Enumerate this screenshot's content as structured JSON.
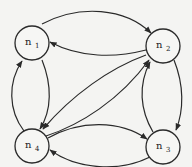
{
  "diagram": {
    "type": "directed-graph",
    "colors": {
      "background": "#f4f4f2",
      "stroke": "#2a2a2a",
      "text": "#222222"
    },
    "nodes": [
      {
        "id": "n1",
        "label": "n",
        "subscript": "1",
        "cx": 32,
        "cy": 43,
        "r": 17
      },
      {
        "id": "n2",
        "label": "n",
        "subscript": "2",
        "cx": 163,
        "cy": 46,
        "r": 17
      },
      {
        "id": "n3",
        "label": "n",
        "subscript": "3",
        "cx": 163,
        "cy": 147,
        "r": 17
      },
      {
        "id": "n4",
        "label": "n",
        "subscript": "4",
        "cx": 32,
        "cy": 146,
        "r": 17
      }
    ],
    "edges": [
      {
        "from": "n1",
        "to": "n2",
        "path": "M42,24 C80,4 125,8 151,33"
      },
      {
        "from": "n2",
        "to": "n1",
        "path": "M146,50 C115,58 80,58 50,42"
      },
      {
        "from": "n1",
        "to": "n4",
        "path": "M42,60 C52,85 52,110 40,129"
      },
      {
        "from": "n4",
        "to": "n1",
        "path": "M24,131 C8,110 8,82 22,61"
      },
      {
        "from": "n2",
        "to": "n3",
        "path": "M174,60 C184,85 184,110 176,130"
      },
      {
        "from": "n3",
        "to": "n2",
        "path": "M153,132 C140,110 138,85 150,62"
      },
      {
        "from": "n4",
        "to": "n3",
        "path": "M48,138 C80,120 120,120 147,139"
      },
      {
        "from": "n3",
        "to": "n4",
        "path": "M150,157 C120,172 78,170 50,150"
      },
      {
        "from": "n4",
        "to": "n2",
        "path": "M46,136 C80,125 120,100 149,60"
      },
      {
        "from": "n2",
        "to": "n4",
        "path": "M146,55 C110,68 72,95 43,129"
      }
    ]
  }
}
